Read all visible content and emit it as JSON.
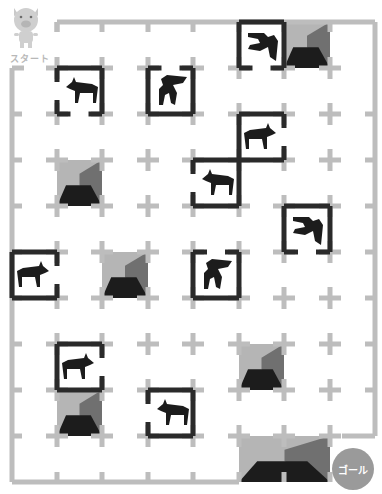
{
  "game": {
    "type": "maze",
    "start_label": "スタート",
    "goal_label": "ゴール",
    "colors": {
      "grid": "#bdbdbd",
      "wall": "#2a2a2a",
      "pit_light": "#b5b5b5",
      "pit_mid": "#707070",
      "pit_dark": "#1c1c1c",
      "goal": "#9a9a9a"
    },
    "grid": {
      "cols": 8,
      "rows": 10,
      "x_lines": [
        12,
        57,
        102,
        148,
        193,
        239,
        284,
        330,
        375
      ],
      "y_lines": [
        22,
        68,
        114,
        160,
        206,
        252,
        298,
        344,
        390,
        436,
        482
      ]
    },
    "dogs": [
      {
        "col": 1,
        "row": 1,
        "pose": "standing",
        "facing": "left",
        "opening": "left-bottom"
      },
      {
        "col": 3,
        "row": 1,
        "pose": "jumping",
        "facing": "up",
        "opening": "top"
      },
      {
        "col": 5,
        "row": 0,
        "pose": "jumping",
        "facing": "down",
        "opening": "bottom"
      },
      {
        "col": 5,
        "row": 2,
        "pose": "standing",
        "facing": "right",
        "opening": "right"
      },
      {
        "col": 4,
        "row": 3,
        "pose": "standing",
        "facing": "left",
        "opening": "left"
      },
      {
        "col": 6,
        "row": 4,
        "pose": "jumping",
        "facing": "down",
        "opening": "bottom"
      },
      {
        "col": 0,
        "row": 5,
        "pose": "standing",
        "facing": "right",
        "opening": "right"
      },
      {
        "col": 4,
        "row": 5,
        "pose": "jumping",
        "facing": "up",
        "opening": "top"
      },
      {
        "col": 1,
        "row": 7,
        "pose": "standing",
        "facing": "right",
        "opening": "right"
      },
      {
        "col": 3,
        "row": 8,
        "pose": "standing",
        "facing": "left",
        "opening": "left"
      }
    ],
    "pits": [
      {
        "col": 6,
        "row": 0,
        "w": 1,
        "h": 1
      },
      {
        "col": 1,
        "row": 3,
        "w": 1,
        "h": 1
      },
      {
        "col": 2,
        "row": 5,
        "w": 1,
        "h": 1
      },
      {
        "col": 5,
        "row": 7,
        "w": 1,
        "h": 1
      },
      {
        "col": 1,
        "row": 8,
        "w": 1,
        "h": 1
      },
      {
        "col": 5,
        "row": 9,
        "w": 2,
        "h": 1
      }
    ]
  }
}
